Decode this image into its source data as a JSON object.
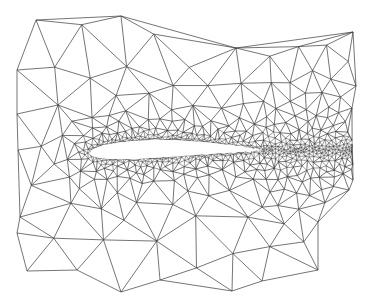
{
  "figure": {
    "mesh_type": "triangular",
    "refinement": "dense near airfoil surface and wake",
    "colors": {
      "background": "#ffffff",
      "mesh_lines": "#3a3a3a",
      "airfoil_fill": "#ffffff"
    }
  }
}
